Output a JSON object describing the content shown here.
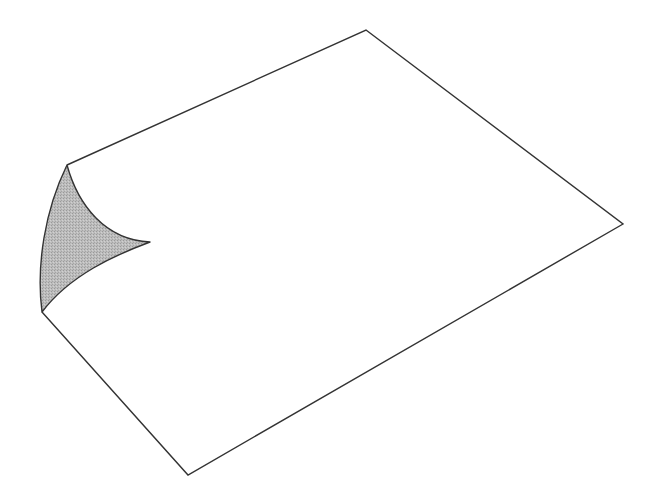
{
  "figure": {
    "colors": {
      "background": "#ffffff",
      "stroke": "#333333",
      "curl_fill": "#b3b3b3"
    },
    "page_points": {
      "top": [
        366,
        30
      ],
      "right": [
        623,
        224
      ],
      "bottom": [
        188,
        475
      ],
      "curl_bottom": [
        42,
        312
      ],
      "curl_top": [
        67,
        165
      ],
      "curl_tip": [
        150,
        242
      ]
    }
  }
}
